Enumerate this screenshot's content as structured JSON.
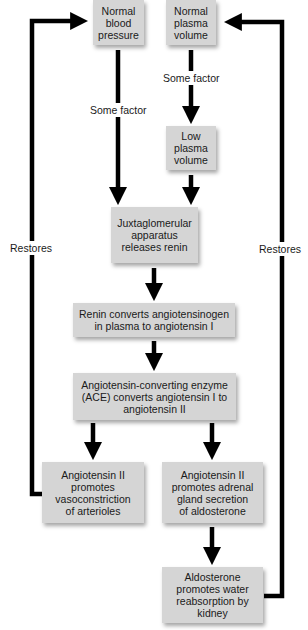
{
  "diagram": {
    "nodes": {
      "normal_bp": "Normal\nblood\npressure",
      "normal_pv": "Normal\nplasma\nvolume",
      "low_pv": "Low\nplasma\nvolume",
      "jga": "Juxtaglomerular\napparatus\nreleases renin",
      "renin": "Renin converts angiotensinogen\nin plasma to angiotensin I",
      "ace": "Angiotensin-converting enzyme\n(ACE) converts angiotensin I to\nangiotensin II",
      "vasoconstriction": "Angiotensin II\npromotes\nvasoconstriction\nof arterioles",
      "adrenal": "Angiotensin II\npromotes adrenal\ngland secretion\nof aldosterone",
      "aldosterone": "Aldosterone\npromotes water\nreabsorption by\nkidney"
    },
    "edge_labels": {
      "bp_factor": "Some factor",
      "pv_factor": "Some factor",
      "restores_left": "Restores",
      "restores_right": "Restores"
    },
    "edges": [
      {
        "from": "normal_bp",
        "to": "jga",
        "label": "Some factor"
      },
      {
        "from": "normal_pv",
        "to": "low_pv",
        "label": "Some factor"
      },
      {
        "from": "low_pv",
        "to": "jga"
      },
      {
        "from": "jga",
        "to": "renin"
      },
      {
        "from": "renin",
        "to": "ace"
      },
      {
        "from": "ace",
        "to": "vasoconstriction"
      },
      {
        "from": "ace",
        "to": "adrenal"
      },
      {
        "from": "adrenal",
        "to": "aldosterone"
      },
      {
        "from": "vasoconstriction",
        "to": "normal_bp",
        "label": "Restores"
      },
      {
        "from": "aldosterone",
        "to": "normal_pv",
        "label": "Restores"
      }
    ],
    "colors": {
      "box_fill": "#d5d5d5",
      "line": "#000000",
      "background": "#ffffff"
    }
  }
}
